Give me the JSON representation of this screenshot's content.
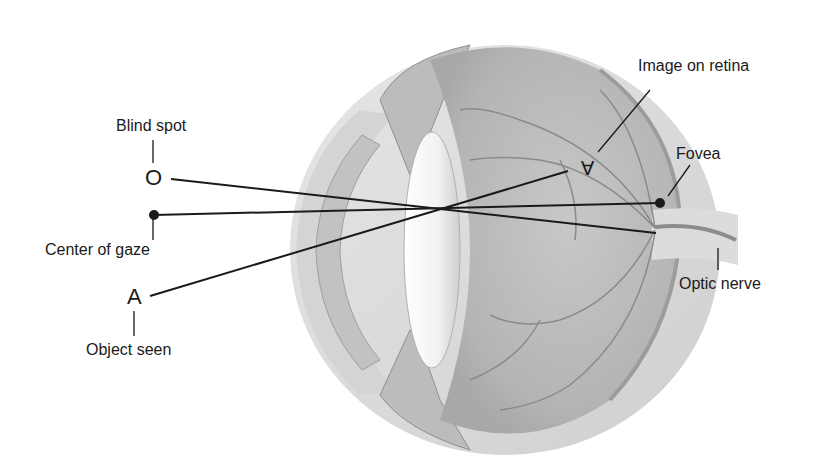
{
  "diagram": {
    "type": "eye-cross-section",
    "labels": {
      "blind_spot": "Blind spot",
      "center_of_gaze": "Center of gaze",
      "object_seen": "Object seen",
      "image_on_retina": "Image on retina",
      "fovea": "Fovea",
      "optic_nerve": "Optic nerve"
    },
    "symbols": {
      "blind_spot_marker": "O",
      "object_marker": "A",
      "retina_image": "A"
    },
    "colors": {
      "background": "#ffffff",
      "line": "#1a1a1a",
      "sclera": "#d9d9d9",
      "vitreous": "#bdbdbd",
      "lens": "#f4f4f4",
      "vessels": "#8a8a8a"
    }
  }
}
